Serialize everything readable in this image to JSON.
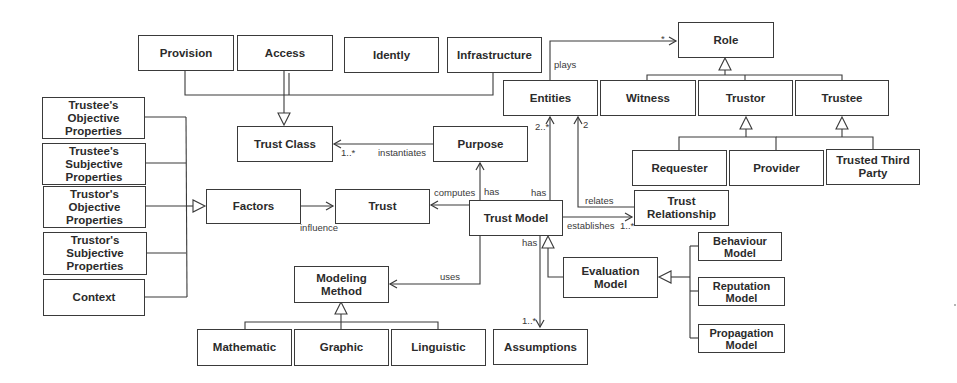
{
  "diagram": {
    "type": "uml-class-diagram",
    "classes": {
      "provision": "Provision",
      "access": "Access",
      "idently": "Idently",
      "infrastructure": "Infrastructure",
      "role": "Role",
      "entities": "Entities",
      "witness": "Witness",
      "trustor": "Trustor",
      "trustee": "Trustee",
      "trust_class": "Trust Class",
      "purpose": "Purpose",
      "requester": "Requester",
      "provider": "Provider",
      "trusted_third_party": "Trusted Third\nParty",
      "trustee_objective": "Trustee's\nObjective\nProperties",
      "trustee_subjective": "Trustee's\nSubjective\nProperties",
      "trustor_objective": "Trustor's\nObjective\nProperties",
      "trustor_subjective": "Trustor's\nSubjective\nProperties",
      "context": "Context",
      "factors": "Factors",
      "trust": "Trust",
      "trust_model": "Trust Model",
      "trust_relationship": "Trust\nRelationship",
      "modeling_method": "Modeling\nMethod",
      "evaluation_model": "Evaluation\nModel",
      "behaviour_model": "Behaviour\nModel",
      "reputation_model": "Reputation\nModel",
      "propagation_model": "Propagation\nModel",
      "mathematic": "Mathematic",
      "graphic": "Graphic",
      "linguistic": "Linguistic",
      "assumptions": "Assumptions"
    },
    "labels": {
      "plays": "plays",
      "plays_mult": "*",
      "instantiates": "instantiates",
      "instantiates_mult": "1..*",
      "entities_mult_a": "2..*",
      "entities_mult_b": "2",
      "computes": "computes",
      "has_purpose": "has",
      "has_entities": "has",
      "relates": "relates",
      "establishes": "establishes",
      "establishes_mult": "1..*",
      "influence": "influence",
      "uses": "uses",
      "has_assumptions": "has",
      "assumptions_mult": "1..*"
    },
    "relationships": [
      {
        "from": "Provision",
        "to": "Trust Class",
        "kind": "generalization"
      },
      {
        "from": "Access",
        "to": "Trust Class",
        "kind": "generalization"
      },
      {
        "from": "Idently",
        "to": "Trust Class",
        "kind": "generalization"
      },
      {
        "from": "Infrastructure",
        "to": "Trust Class",
        "kind": "generalization"
      },
      {
        "from": "Entities",
        "to": "Role",
        "kind": "association",
        "label": "plays",
        "multiplicity": "*"
      },
      {
        "from": "Witness",
        "to": "Role",
        "kind": "generalization"
      },
      {
        "from": "Trustor",
        "to": "Role",
        "kind": "generalization"
      },
      {
        "from": "Trustee",
        "to": "Role",
        "kind": "generalization"
      },
      {
        "from": "Requester",
        "to": "Trustor",
        "kind": "generalization"
      },
      {
        "from": "Provider",
        "to": "Trustor",
        "kind": "generalization"
      },
      {
        "from": "Provider",
        "to": "Trustee",
        "kind": "generalization"
      },
      {
        "from": "Trusted Third Party",
        "to": "Trustee",
        "kind": "generalization"
      },
      {
        "from": "Purpose",
        "to": "Trust Class",
        "kind": "association",
        "label": "instantiates",
        "multiplicity": "1..*"
      },
      {
        "from": "Trust Model",
        "to": "Purpose",
        "kind": "association",
        "label": "has"
      },
      {
        "from": "Trust Model",
        "to": "Entities",
        "kind": "association",
        "label": "has",
        "multiplicity": "2..*"
      },
      {
        "from": "Trust Relationship",
        "to": "Entities",
        "kind": "association",
        "label": "relates",
        "multiplicity": "2"
      },
      {
        "from": "Trust Model",
        "to": "Trust",
        "kind": "association",
        "label": "computes"
      },
      {
        "from": "Trust Model",
        "to": "Trust Relationship",
        "kind": "association",
        "label": "establishes",
        "multiplicity": "1..*"
      },
      {
        "from": "Factors",
        "to": "Trust",
        "kind": "association",
        "label": "influence"
      },
      {
        "from": "Trustee's Objective Properties",
        "to": "Factors",
        "kind": "generalization"
      },
      {
        "from": "Trustee's Subjective Properties",
        "to": "Factors",
        "kind": "generalization"
      },
      {
        "from": "Trustor's Objective Properties",
        "to": "Factors",
        "kind": "generalization"
      },
      {
        "from": "Trustor's Subjective Properties",
        "to": "Factors",
        "kind": "generalization"
      },
      {
        "from": "Context",
        "to": "Factors",
        "kind": "generalization"
      },
      {
        "from": "Trust Model",
        "to": "Modeling Method",
        "kind": "association",
        "label": "uses"
      },
      {
        "from": "Mathematic",
        "to": "Modeling Method",
        "kind": "generalization"
      },
      {
        "from": "Graphic",
        "to": "Modeling Method",
        "kind": "generalization"
      },
      {
        "from": "Linguistic",
        "to": "Modeling Method",
        "kind": "generalization"
      },
      {
        "from": "Trust Model",
        "to": "Assumptions",
        "kind": "association",
        "label": "has",
        "multiplicity": "1..*"
      },
      {
        "from": "Evaluation Model",
        "to": "Trust Model",
        "kind": "generalization"
      },
      {
        "from": "Behaviour Model",
        "to": "Evaluation Model",
        "kind": "generalization"
      },
      {
        "from": "Reputation Model",
        "to": "Evaluation Model",
        "kind": "generalization"
      },
      {
        "from": "Propagation Model",
        "to": "Evaluation Model",
        "kind": "generalization"
      }
    ]
  }
}
